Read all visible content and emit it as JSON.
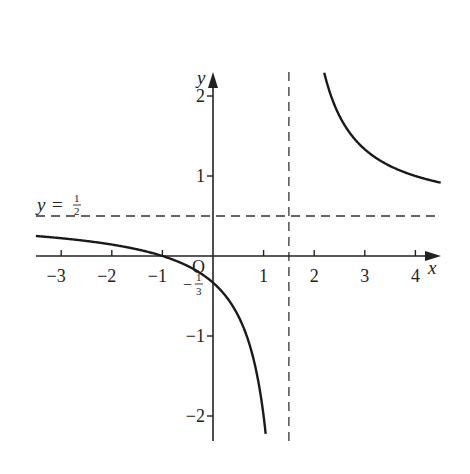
{
  "chart_data": {
    "type": "line",
    "title": "",
    "function": "y = (x + 1) / (2x - 3)",
    "xlabel": "x",
    "ylabel": "y",
    "origin_label": "O",
    "xlim": [
      -3.5,
      4.5
    ],
    "ylim": [
      -2.3,
      2.3
    ],
    "grid": false,
    "x_ticks": [
      -3,
      -2,
      -1,
      1,
      2,
      3,
      4
    ],
    "x_tick_labels": [
      "−3",
      "−2",
      "−1",
      "1",
      "2",
      "3",
      "4"
    ],
    "y_ticks": [
      2,
      1,
      -1,
      -2
    ],
    "y_tick_labels": [
      "2",
      "1",
      "−1",
      "−2"
    ],
    "asymptotes": {
      "vertical": {
        "x": 1.5,
        "style": "dashed"
      },
      "horizontal": {
        "y": 0.5,
        "style": "dashed",
        "label": "y = ½"
      }
    },
    "annotations": [
      {
        "text": "−⅓",
        "x": 0,
        "y": -0.3333,
        "meaning": "y-intercept"
      }
    ],
    "key_points": [
      {
        "x": -1,
        "y": 0
      },
      {
        "x": 0,
        "y": -0.3333
      }
    ],
    "series": [
      {
        "name": "left-branch",
        "x": [
          -3.5,
          -3,
          -2,
          -1,
          0,
          0.5,
          1,
          1.2
        ],
        "y": [
          0.25,
          0.2222,
          0.1429,
          0.0,
          -0.3333,
          -0.75,
          -2.0,
          -3.6667
        ]
      },
      {
        "name": "right-branch",
        "x": [
          1.95,
          2,
          2.5,
          3,
          3.5,
          4,
          4.5
        ],
        "y": [
          3.28,
          3.0,
          1.75,
          1.3333,
          1.125,
          1.0,
          0.9167
        ]
      }
    ]
  },
  "labels": {
    "x_axis": "x",
    "y_axis": "y",
    "origin": "O",
    "y_intercept_num": "1",
    "y_intercept_den": "3",
    "asymptote_y_prefix": "y =",
    "asymptote_num": "1",
    "asymptote_den": "2"
  }
}
